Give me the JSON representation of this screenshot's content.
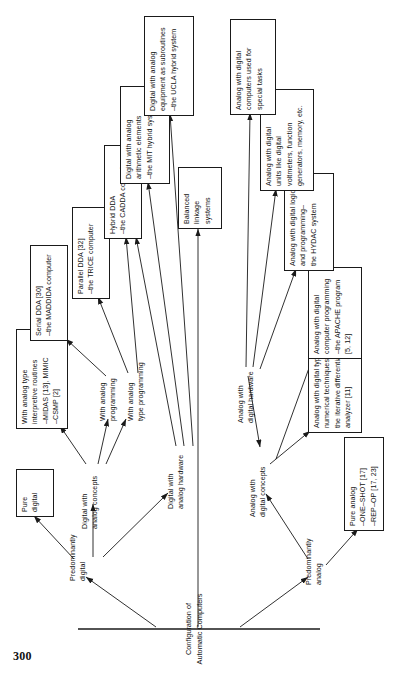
{
  "page": {
    "number": "300",
    "figure_orientation": "rotated-90-ccw",
    "ink_color": "#111111",
    "paper_color": "#ffffff"
  },
  "diagram": {
    "root": {
      "label": "Configuration of\nAutomatic Computers"
    },
    "branch_labels": [
      {
        "id": "predominantly-digital",
        "label": "Predominantly\ndigital"
      },
      {
        "id": "digital-with-analog-concepts",
        "label": "Digital with\nanalog concepts"
      },
      {
        "id": "with-analog-programming",
        "label": "With analog\nprogramming"
      },
      {
        "id": "with-analog-type-programming",
        "label": "With analog\ntype programming"
      },
      {
        "id": "digital-with-analog-hardware",
        "label": "Digital with\nanalog hardware"
      },
      {
        "id": "predominantly-analog",
        "label": "Predominantly\nanalog"
      },
      {
        "id": "analog-with-digital-concepts",
        "label": "Analog with\ndigital concepts"
      },
      {
        "id": "analog-with-digital-hardware",
        "label": "Analog with\ndigital hardware"
      }
    ],
    "boxes": [
      {
        "id": "pure-digital",
        "text": "Pure\ndigital"
      },
      {
        "id": "analog-interpretive-routines",
        "text": "With analog type\ninterpretive routines\n–MIDAS [13], MIMIC\n–CSMP [2]"
      },
      {
        "id": "serial-dda",
        "text": "Serial DDA [30]\n–the MADDIDA computer"
      },
      {
        "id": "parallel-dda",
        "text": "Parallel DDA [32]\n–the TRICE computer"
      },
      {
        "id": "hybrid-dda",
        "text": "Hybrid DDA\n–the CADDA computer"
      },
      {
        "id": "mit-hybrid",
        "text": "Digital with analog\narithmetic elements\n–the MIT hybrid system"
      },
      {
        "id": "ucla-hybrid",
        "text": "Digital with analog\nequipment as subroutines\n–the UCLA hybrid system"
      },
      {
        "id": "balanced-linkage",
        "text": "Balanced\nlinkage\nsystems"
      },
      {
        "id": "pure-analog",
        "text": "Pure analog\n–ONE–SHOT [17]\n–REP–OP [17, 23]"
      },
      {
        "id": "iterative-differential-analyzer",
        "text": "Analog with digital type\nnumerical techniques–\nthe iterative differential\nanalyzer [11]"
      },
      {
        "id": "apache-program",
        "text": "Analog with digital\ncomputer programming\n–the APACHE program\n[5, 12]"
      },
      {
        "id": "hydac-system",
        "text": "Analog with digital logic\nand programming–\nthe HYDAC system"
      },
      {
        "id": "analog-with-digital-units",
        "text": "Analog with digital\nunits like digital\nvoltmeters, function\ngenerators, memory, etc."
      },
      {
        "id": "digital-computers-special-tasks",
        "text": "Analog with digital\ncomputers used for\nspecial tasks"
      }
    ]
  }
}
